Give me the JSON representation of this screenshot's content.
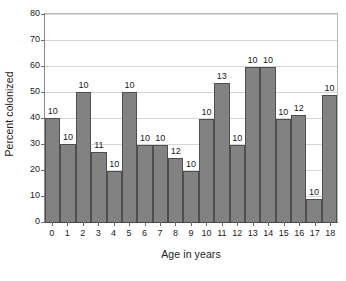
{
  "chart_data": {
    "type": "bar",
    "title": "",
    "xlabel": "Age in years",
    "ylabel": "Percent colonized",
    "categories": [
      "0",
      "1",
      "2",
      "3",
      "4",
      "5",
      "6",
      "7",
      "8",
      "9",
      "10",
      "11",
      "12",
      "13",
      "14",
      "15",
      "16",
      "17",
      "18"
    ],
    "values": [
      40,
      30,
      50,
      27,
      19.5,
      50,
      29.5,
      29.5,
      24.5,
      19.5,
      39.5,
      53.5,
      29.5,
      59.5,
      59.5,
      39.5,
      41,
      9,
      49
    ],
    "point_labels": [
      "10",
      "10",
      "10",
      "11",
      "10",
      "10",
      "10",
      "10",
      "12",
      "10",
      "10",
      "13",
      "10",
      "10",
      "10",
      "10",
      "12",
      "10",
      "10"
    ],
    "ylim": [
      0,
      80
    ],
    "yticks": [
      0,
      10,
      20,
      30,
      40,
      50,
      60,
      70,
      80
    ],
    "ytick_labels": [
      "0",
      "10",
      "20",
      "30",
      "40",
      "50",
      "60",
      "70",
      "80"
    ],
    "grid": "horizontal",
    "legend": "none",
    "bar_color": "#828282",
    "bar_edge_color": "#4e4e4e",
    "gridline_color": "#d5d5d5",
    "background_color": "#ffffff"
  }
}
